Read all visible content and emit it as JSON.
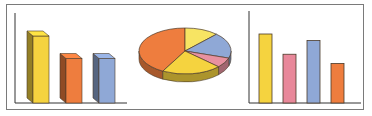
{
  "chart_data": [
    {
      "type": "bar",
      "style": "3d",
      "title": "",
      "xlabel": "",
      "ylabel": "",
      "categories": [
        "A",
        "B",
        "C"
      ],
      "values": [
        80,
        55,
        55
      ],
      "colors": [
        "#f5d33f",
        "#ee7d3e",
        "#8fa8d6"
      ],
      "ylim": [
        0,
        100
      ],
      "grid": false,
      "legend": "none"
    },
    {
      "type": "pie",
      "style": "3d",
      "title": "",
      "labels": [
        "Orange",
        "Yellow (top)",
        "Blue",
        "Pink",
        "Yellow (bottom)"
      ],
      "values": [
        42,
        12,
        18,
        7,
        21
      ],
      "colors": [
        "#ee7d3e",
        "#f7e463",
        "#8fa8d6",
        "#e891a0",
        "#f5d33f"
      ],
      "legend": "none"
    },
    {
      "type": "bar",
      "style": "flat",
      "title": "",
      "xlabel": "",
      "ylabel": "",
      "categories": [
        "A",
        "B",
        "C",
        "D"
      ],
      "values": [
        75,
        53,
        68,
        43
      ],
      "colors": [
        "#f5d33f",
        "#e8889a",
        "#8fa8d6",
        "#ee7d3e"
      ],
      "ylim": [
        0,
        100
      ],
      "grid": false,
      "legend": "none"
    }
  ],
  "colors": {
    "frame_border": "#7a7a7a",
    "axis": "#333333",
    "outline": "#4a3a2a"
  }
}
